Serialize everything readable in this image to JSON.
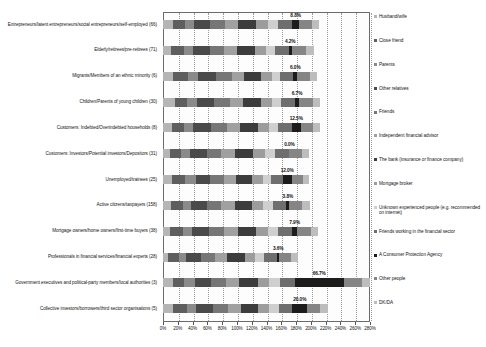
{
  "chart_data": {
    "type": "bar",
    "subtype": "horizontal-stacked",
    "title": "",
    "xlabel": "",
    "ylabel": "",
    "xlim": [
      0,
      280
    ],
    "xticks": [
      0,
      20,
      40,
      60,
      80,
      100,
      120,
      140,
      160,
      180,
      200,
      220,
      240,
      260,
      280
    ],
    "xticklabels": [
      "0%",
      "20%",
      "40%",
      "60%",
      "80%",
      "100%",
      "120%",
      "140%",
      "160%",
      "180%",
      "200%",
      "220%",
      "240%",
      "260%",
      "280%"
    ],
    "grid": true,
    "grid_axis": "x",
    "legend_position": "right",
    "categories": [
      "Entrepreneurs/latent entrepreneurs/social entrepreneurs/self-employed (66)",
      "Elderly/retirees/pre-retirees (71)",
      "Migrants/Members of an ethnic minority (6)",
      "Children/Parents of young children (30)",
      "Customers: Indebted/Overindebted households (8)",
      "Customers: Investors/Potential investors/Depositors (31)",
      "Unemployed/trainees (25)",
      "Active citizens/taxpayers (158)",
      "Mortgage owners/home owners/first-time buyers (38)",
      "Professionals in financial services/financial experts (28)",
      "Government executives and political-party members/local authorities (3)",
      "Collective investors/borrowers/third sector organisations (5)"
    ],
    "series": [
      {
        "name": "Husband/wife",
        "color": "#b5b5b5",
        "values": [
          13,
          11,
          14,
          16,
          12,
          10,
          12,
          11,
          10,
          7,
          13,
          14
        ]
      },
      {
        "name": "Close friend",
        "color": "#5e5e5e",
        "values": [
          17,
          18,
          20,
          17,
          16,
          15,
          18,
          16,
          17,
          14,
          16,
          18
        ]
      },
      {
        "name": "Parents",
        "color": "#8a8a8a",
        "values": [
          12,
          12,
          14,
          13,
          13,
          12,
          14,
          11,
          12,
          10,
          14,
          13
        ]
      },
      {
        "name": "Other relatives",
        "color": "#4a4a4a",
        "values": [
          22,
          22,
          24,
          23,
          24,
          22,
          20,
          21,
          23,
          20,
          22,
          22
        ]
      },
      {
        "name": "Friends",
        "color": "#767676",
        "values": [
          20,
          20,
          21,
          21,
          21,
          20,
          19,
          20,
          21,
          19,
          20,
          21
        ]
      },
      {
        "name": "Independent financial advisor",
        "color": "#a0a0a0",
        "values": [
          18,
          17,
          17,
          18,
          18,
          18,
          16,
          18,
          18,
          17,
          18,
          18
        ]
      },
      {
        "name": "The bank (insurance or finance company)",
        "color": "#3c3c3c",
        "values": [
          24,
          24,
          23,
          24,
          25,
          25,
          22,
          24,
          25,
          24,
          25,
          23
        ]
      },
      {
        "name": "Mortgage broker",
        "color": "#9c9c9c",
        "values": [
          16,
          15,
          14,
          15,
          15,
          16,
          14,
          15,
          16,
          14,
          16,
          15
        ]
      },
      {
        "name": "Unknown experienced people (e.g. recommended on internet)",
        "color": "#cfcfcf",
        "values": [
          14,
          13,
          12,
          13,
          12,
          14,
          11,
          13,
          13,
          12,
          14,
          13
        ]
      },
      {
        "name": "Friends working in the financial sector",
        "color": "#6e6e6e",
        "values": [
          19,
          18,
          17,
          18,
          18,
          19,
          16,
          18,
          19,
          17,
          20,
          18
        ]
      },
      {
        "name": "A Consumer Protection Agency",
        "color": "#1c1c1c",
        "values": [
          8.8,
          4.2,
          6.0,
          6.7,
          12.5,
          0.0,
          12.0,
          3.8,
          7.9,
          3.6,
          66.7,
          20.0
        ]
      },
      {
        "name": "Other people",
        "color": "#858585",
        "values": [
          18,
          19,
          17,
          18,
          17,
          17,
          16,
          18,
          18,
          16,
          25,
          18
        ]
      },
      {
        "name": "DK/DA",
        "color": "#bdbdbd",
        "values": [
          10,
          11,
          9,
          10,
          9,
          10,
          8,
          10,
          10,
          9,
          11,
          10
        ]
      }
    ],
    "data_labels": [
      {
        "category_index": 0,
        "value": 8.8,
        "text": "8.8%"
      },
      {
        "category_index": 1,
        "value": 4.2,
        "text": "4.2%"
      },
      {
        "category_index": 2,
        "value": 6.0,
        "text": "6.0%"
      },
      {
        "category_index": 3,
        "value": 6.7,
        "text": "6.7%"
      },
      {
        "category_index": 4,
        "value": 12.5,
        "text": "12.5%"
      },
      {
        "category_index": 5,
        "value": 0.0,
        "text": "0.0%"
      },
      {
        "category_index": 6,
        "value": 12.0,
        "text": "12.0%"
      },
      {
        "category_index": 7,
        "value": 3.8,
        "text": "3.8%"
      },
      {
        "category_index": 8,
        "value": 7.9,
        "text": "7.9%"
      },
      {
        "category_index": 9,
        "value": 3.6,
        "text": "3.6%"
      },
      {
        "category_index": 10,
        "value": 66.7,
        "text": "66.7%"
      },
      {
        "category_index": 11,
        "value": 20.0,
        "text": "20.0%"
      }
    ],
    "legend_entries": [
      "Husband/wife",
      "Close friend",
      "Parents",
      "Other relatives",
      "Friends",
      "Independent financial advisor",
      "The bank (insurance or finance company)",
      "Mortgage broker",
      "Unknown experienced people (e.g. recommended on internet)",
      "Friends working in the financial sector",
      "A Consumer Protection Agency",
      "Other people",
      "DK/DA"
    ]
  }
}
